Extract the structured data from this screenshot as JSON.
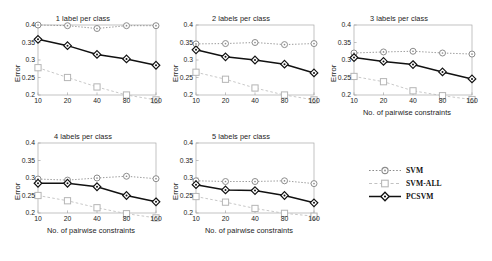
{
  "chart_data": [
    {
      "type": "line",
      "title": "1 label per class",
      "xlabel": "",
      "ylabel": "Error",
      "categories": [
        "10",
        "20",
        "40",
        "80",
        "160"
      ],
      "x": [
        10,
        20,
        40,
        80,
        160
      ],
      "ylim": [
        0.2,
        0.4
      ],
      "yticks": [
        "0.2",
        "0.25",
        "0.3",
        "0.35",
        "0.4"
      ],
      "ytickvals": [
        0.2,
        0.25,
        0.3,
        0.35,
        0.4
      ],
      "grid": false,
      "legend_position": "outside-right-bottom",
      "series": [
        {
          "name": "SVM",
          "values": [
            0.4,
            0.398,
            0.39,
            0.398,
            0.398
          ]
        },
        {
          "name": "SVM-ALL",
          "values": [
            0.278,
            0.25,
            0.223,
            0.2,
            0.186
          ]
        },
        {
          "name": "PCSVM",
          "values": [
            0.359,
            0.341,
            0.316,
            0.303,
            0.285
          ]
        }
      ]
    },
    {
      "type": "line",
      "title": "2 labels per class",
      "xlabel": "",
      "ylabel": "Error",
      "categories": [
        "10",
        "20",
        "40",
        "80",
        "160"
      ],
      "x": [
        10,
        20,
        40,
        80,
        160
      ],
      "ylim": [
        0.2,
        0.4
      ],
      "yticks": [
        "0.2",
        "0.25",
        "0.3",
        "0.35",
        "0.4"
      ],
      "ytickvals": [
        0.2,
        0.25,
        0.3,
        0.35,
        0.4
      ],
      "grid": false,
      "series": [
        {
          "name": "SVM",
          "values": [
            0.346,
            0.347,
            0.35,
            0.344,
            0.347
          ]
        },
        {
          "name": "SVM-ALL",
          "values": [
            0.265,
            0.245,
            0.22,
            0.2,
            0.186
          ]
        },
        {
          "name": "PCSVM",
          "values": [
            0.329,
            0.309,
            0.3,
            0.288,
            0.263
          ]
        }
      ]
    },
    {
      "type": "line",
      "title": "3 labels per class",
      "xlabel": "No. of pairwise constraints",
      "ylabel": "Error",
      "categories": [
        "10",
        "20",
        "40",
        "80",
        "160"
      ],
      "x": [
        10,
        20,
        40,
        80,
        160
      ],
      "ylim": [
        0.2,
        0.4
      ],
      "yticks": [
        "0.2",
        "0.25",
        "0.3",
        "0.35",
        "0.4"
      ],
      "ytickvals": [
        0.2,
        0.25,
        0.3,
        0.35,
        0.4
      ],
      "grid": false,
      "series": [
        {
          "name": "SVM",
          "values": [
            0.32,
            0.323,
            0.325,
            0.32,
            0.317
          ]
        },
        {
          "name": "SVM-ALL",
          "values": [
            0.253,
            0.238,
            0.212,
            0.198,
            0.187
          ]
        },
        {
          "name": "PCSVM",
          "values": [
            0.307,
            0.296,
            0.287,
            0.266,
            0.246
          ]
        }
      ]
    },
    {
      "type": "line",
      "title": "4 labels per class",
      "xlabel": "No. of pairwise constraints",
      "ylabel": "Error",
      "categories": [
        "10",
        "20",
        "40",
        "80",
        "160"
      ],
      "x": [
        10,
        20,
        40,
        80,
        160
      ],
      "ylim": [
        0.2,
        0.4
      ],
      "yticks": [
        "0.2",
        "0.25",
        "0.3",
        "0.35",
        "0.4"
      ],
      "ytickvals": [
        0.2,
        0.25,
        0.3,
        0.35,
        0.4
      ],
      "grid": false,
      "series": [
        {
          "name": "SVM",
          "values": [
            0.297,
            0.294,
            0.3,
            0.305,
            0.298
          ]
        },
        {
          "name": "SVM-ALL",
          "values": [
            0.25,
            0.235,
            0.215,
            0.198,
            0.186
          ]
        },
        {
          "name": "PCSVM",
          "values": [
            0.285,
            0.285,
            0.275,
            0.25,
            0.232
          ]
        }
      ]
    },
    {
      "type": "line",
      "title": "5 labels per class",
      "xlabel": "No. of pairwise constraints",
      "ylabel": "Error",
      "categories": [
        "10",
        "20",
        "40",
        "80",
        "160"
      ],
      "x": [
        10,
        20,
        40,
        80,
        160
      ],
      "ylim": [
        0.2,
        0.4
      ],
      "yticks": [
        "0.2",
        "0.25",
        "0.3",
        "0.35",
        "0.4"
      ],
      "ytickvals": [
        0.2,
        0.25,
        0.3,
        0.35,
        0.4
      ],
      "grid": false,
      "series": [
        {
          "name": "SVM",
          "values": [
            0.292,
            0.29,
            0.29,
            0.292,
            0.284
          ]
        },
        {
          "name": "SVM-ALL",
          "values": [
            0.247,
            0.231,
            0.213,
            0.199,
            0.191
          ]
        },
        {
          "name": "PCSVM",
          "values": [
            0.281,
            0.266,
            0.264,
            0.25,
            0.229
          ]
        }
      ]
    }
  ],
  "legend": {
    "items": [
      {
        "label": "SVM",
        "marker": "circle",
        "line": "dotted",
        "color": "#8c8c8c"
      },
      {
        "label": "SVM-ALL",
        "marker": "square",
        "line": "dashed",
        "color": "#c2c2c2"
      },
      {
        "label": "PCSVM",
        "marker": "diamond",
        "line": "solid",
        "color": "#111111"
      }
    ]
  },
  "colors": {
    "svm": "#8c8c8c",
    "svm_all": "#c2c2c2",
    "pcsvm": "#111111",
    "axis": "#a8a8a8",
    "text": "#1c1c1c",
    "background": "#ffffff"
  }
}
